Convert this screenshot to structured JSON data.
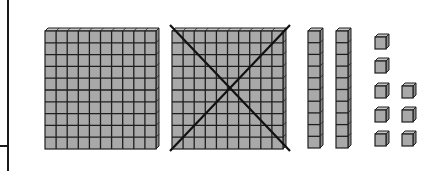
{
  "diagram": {
    "type": "base-ten-blocks",
    "colors": {
      "block_fill": "#a9a9a9",
      "block_top": "#c4c4c4",
      "block_side": "#8a8a8a",
      "grid_line": "#1e1e1e",
      "cross_line": "#111111",
      "frame_line": "#1a1a1a"
    },
    "flats": [
      {
        "label": "hundred-flat",
        "crossed_out": false
      },
      {
        "label": "hundred-flat",
        "crossed_out": true
      }
    ],
    "rods": [
      {
        "label": "ten-rod"
      },
      {
        "label": "ten-rod"
      }
    ],
    "units": {
      "label": "unit-cubes",
      "count": 8,
      "columns": [
        5,
        3
      ]
    }
  }
}
